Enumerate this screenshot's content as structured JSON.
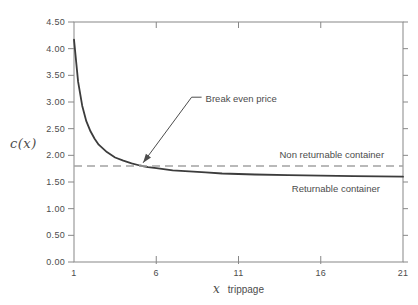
{
  "figure": {
    "background": "#ffffff",
    "frame_color": "#878787",
    "text_color": "#4c4c4c"
  },
  "chart_data": {
    "type": "line",
    "title": "",
    "xlabel_var": "x",
    "xlabel_text": "trippage",
    "ylabel": "c(x)",
    "xlim": [
      1,
      21
    ],
    "ylim": [
      0,
      4.5
    ],
    "x_ticks": [
      1,
      6,
      11,
      16,
      21
    ],
    "y_ticks": [
      "0.00",
      "0.50",
      "1.00",
      "1.50",
      "2.00",
      "2.50",
      "3.00",
      "3.50",
      "4.00",
      "4.50"
    ],
    "grid": false,
    "legend": "inline-labels",
    "series": [
      {
        "name": "Returnable container",
        "style": "solid",
        "color": "#3c3c3c",
        "x": [
          1,
          1.25,
          1.5,
          1.75,
          2,
          2.25,
          2.5,
          3,
          3.5,
          4,
          4.5,
          5,
          5.5,
          6,
          7,
          8,
          9,
          10,
          12,
          14,
          16,
          18,
          21
        ],
        "y": [
          4.17,
          3.38,
          2.93,
          2.64,
          2.45,
          2.31,
          2.2,
          2.06,
          1.96,
          1.9,
          1.85,
          1.81,
          1.78,
          1.76,
          1.72,
          1.7,
          1.68,
          1.66,
          1.64,
          1.63,
          1.62,
          1.61,
          1.6
        ],
        "label_pos": [
          19.6,
          1.31
        ],
        "label_align": "end"
      },
      {
        "name": "Non returnable container",
        "style": "dashed-hline",
        "color": "#a2a2a2",
        "value": 1.8,
        "label_pos": [
          19.85,
          1.95
        ],
        "label_align": "end"
      }
    ],
    "annotation": {
      "text": "Break even price",
      "arrow_tip": [
        5.2,
        1.86
      ],
      "elbow": [
        8.15,
        3.09
      ],
      "text_pos": [
        9.0,
        3.0
      ]
    }
  }
}
